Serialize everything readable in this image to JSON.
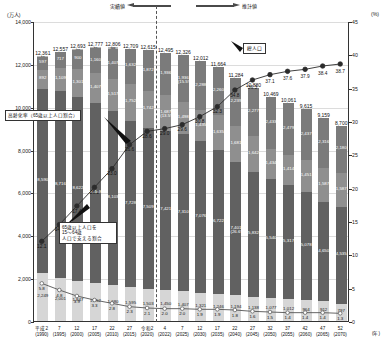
{
  "axes": {
    "left_unit": "(万人)",
    "right_unit": "(%)",
    "left_ticks": [
      "0",
      "2,000",
      "4,000",
      "6,000",
      "8,000",
      "10,000",
      "12,000",
      "14,000"
    ],
    "right_ticks": [
      "0",
      "5",
      "10",
      "15",
      "20",
      "25",
      "30",
      "35",
      "40",
      "45"
    ],
    "x_unit": "(年)"
  },
  "header": {
    "actual_label": "実績値",
    "estimate_label": "推計値"
  },
  "callouts": {
    "aging_rate": "高齢化率（65歳以上人口割合）",
    "support_ratio": "65歳以上人口を\n15～64歳\n人口で支える割合",
    "total_population": "総人口"
  },
  "chart_data": {
    "type": "bar",
    "xlabel": "(年)",
    "ylabel": "(万人)",
    "ylabel_right": "(%)",
    "ylim": [
      0,
      14000
    ],
    "ylim_right": [
      0,
      45
    ],
    "grid": true,
    "categories": [
      "平成2\n(1990)",
      "7\n(1995)",
      "12\n(2000)",
      "17\n(2005)",
      "22\n(2010)",
      "27\n(2015)",
      "令和2\n(2020)",
      "4\n(2022)",
      "7\n(2025)",
      "12\n(2030)",
      "17\n(2035)",
      "22\n(2040)",
      "27\n(2045)",
      "32\n(2050)",
      "37\n(2055)",
      "42\n(2060)",
      "47\n(2065)",
      "52\n(2070)"
    ],
    "totals": [
      "12,361",
      "12,557",
      "12,693",
      "12,777",
      "12,806",
      "12,709",
      "12,615",
      "12,495",
      "12,326",
      "12,012",
      "11,664",
      "11,284",
      "10,880",
      "10,469",
      "10,061",
      "9,615",
      "9,159",
      "8,700"
    ],
    "series": [
      {
        "name": "75歳以上",
        "values": [
          597,
          717,
          900,
          1160,
          1407,
          1632,
          1872,
          1936,
          2180,
          2288,
          2260,
          2239,
          2277,
          2417,
          2446,
          2387,
          2316,
          2180
        ],
        "labels": [
          "597",
          "717",
          "900",
          "1,160",
          "1,407",
          "1,632",
          "1,872",
          "1,936",
          "2,180",
          "2,288",
          "2,260",
          "2,239",
          "2,277",
          "2,433",
          "2,479",
          "2,437",
          "2,316",
          "2,180"
        ]
      },
      {
        "name": "65～74歳",
        "values": [
          892,
          1109,
          1301,
          1407,
          1517,
          1752,
          1742,
          1687,
          1498,
          1435,
          1635,
          1681,
          1642,
          1434,
          1414,
          1451,
          1587,
          1587
        ],
        "labels": [
          "892",
          "1,109",
          "1,301",
          "1,407",
          "1,517",
          "1,752",
          "1,742",
          "1,687",
          "1,498",
          "1,435",
          "1,635",
          "1,681",
          "1,642",
          "1,434",
          "1,414",
          "1,451",
          "1,587",
          "1,587"
        ]
      },
      {
        "name": "15～64歳",
        "values": [
          8590,
          8716,
          8622,
          8409,
          8103,
          7728,
          7509,
          7421,
          7310,
          7076,
          6722,
          6213,
          5832,
          5540,
          5317,
          5078,
          4650,
          4535
        ],
        "labels": [
          "8,590",
          "8,716",
          "8,622",
          "8,409",
          "8,103",
          "7,728",
          "7,509",
          "7,421",
          "7,310",
          "7,076",
          "6,722",
          "6,213",
          "5,832",
          "5,540",
          "5,317",
          "5,078",
          "4,650",
          "4,535"
        ]
      },
      {
        "name": "0～14歳",
        "values": [
          2249,
          2001,
          1847,
          1752,
          1680,
          1595,
          1503,
          1450,
          1407,
          1321,
          1246,
          1194,
          1138,
          1077,
          1012,
          964,
          912,
          797
        ],
        "labels": [
          "2,249",
          "2,001",
          "1,847",
          "1,752",
          "1,680",
          "1,595",
          "1,503",
          "1,450",
          "1,407",
          "1,321",
          "1,246",
          "1,194",
          "1,138",
          "1,077",
          "1,012",
          "964",
          "912",
          "797"
        ]
      },
      {
        "name": "不詳",
        "values": [
          41,
          19,
          22,
          45,
          98,
          0,
          0,
          0,
          0,
          0,
          0,
          0,
          0,
          0,
          0,
          0,
          0,
          0
        ],
        "labels": [
          "41",
          "19",
          "22",
          "45",
          "98",
          "",
          "",
          "",
          "",
          "",
          "",
          "",
          "",
          "",
          "",
          "",
          "",
          ""
        ]
      }
    ],
    "segment_extra_labels": {
      "elderly_share_2022": "1,687\n(13.5%)",
      "elderly_share_2025": "1,936\n(15.5%)",
      "seventyfive_share_2040": "7,401\n(26.6%)"
    },
    "line_aging_rate": {
      "name": "高齢化率（65歳以上人口割合）",
      "values": [
        12.1,
        14.6,
        17.4,
        20.2,
        23.0,
        26.6,
        28.6,
        29.0,
        29.6,
        30.8,
        32.3,
        34.8,
        36.3,
        37.1,
        37.6,
        37.9,
        38.4,
        38.7
      ],
      "labels": [
        "12.1",
        "14.6",
        "17.4",
        "20.2",
        "23.0",
        "26.6",
        "28.6",
        "29.0",
        "29.6",
        "30.8",
        "32.3",
        "34.8",
        "36.3",
        "37.1",
        "37.6",
        "37.9",
        "38.4",
        "38.7"
      ]
    },
    "line_support_ratio": {
      "name": "65歳以上人口を15～64歳人口で支える割合",
      "values": [
        5.8,
        4.8,
        3.9,
        3.3,
        2.8,
        2.3,
        2.1,
        2.0,
        2.0,
        1.9,
        1.9,
        1.8,
        1.6,
        1.5,
        1.4,
        1.4,
        1.4,
        1.3
      ],
      "labels": [
        "5.8",
        "4.8",
        "3.9",
        "3.3",
        "2.8",
        "2.3",
        "2.1",
        "2.0",
        "2.0",
        "1.9",
        "1.9",
        "1.8",
        "1.6",
        "1.5",
        "1.4",
        "1.4",
        "1.4",
        "1.3"
      ]
    },
    "forecast_starts_at_index": 7
  }
}
